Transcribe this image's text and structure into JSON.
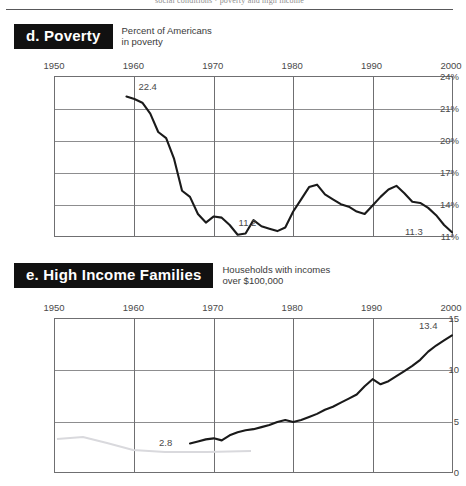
{
  "page": {
    "running_head": "social conditions  ·  poverty and high income"
  },
  "sections": [
    {
      "id": "poverty",
      "badge": "d. Poverty",
      "subtitle": "Percent of Americans\nin poverty",
      "chart_data": {
        "type": "line",
        "title": "d. Poverty",
        "subtitle": "Percent of Americans in poverty",
        "xlabel": "",
        "ylabel": "Percent of Americans in poverty",
        "xlim": [
          1950,
          2000
        ],
        "ylim": [
          11,
          24
        ],
        "xticks": [
          "1950",
          "1960",
          "1970",
          "1980",
          "1990",
          "2000"
        ],
        "yticks": [
          "24%",
          "21%",
          "20%",
          "17%",
          "14%",
          "11%"
        ],
        "grid": true,
        "legend": "none",
        "annotations": [
          {
            "text": "22.4",
            "x": 1960,
            "y": 22.4
          },
          {
            "text": "11.2",
            "x": 1974,
            "y": 11.2
          },
          {
            "text": "11.3",
            "x": 2000,
            "y": 11.3
          }
        ],
        "x": [
          1959,
          1960,
          1961,
          1962,
          1963,
          1964,
          1965,
          1966,
          1967,
          1968,
          1969,
          1970,
          1971,
          1972,
          1973,
          1974,
          1975,
          1976,
          1977,
          1978,
          1979,
          1980,
          1981,
          1982,
          1983,
          1984,
          1985,
          1986,
          1987,
          1988,
          1989,
          1990,
          1991,
          1992,
          1993,
          1994,
          1995,
          1996,
          1997,
          1998,
          1999,
          2000
        ],
        "values": [
          22.4,
          22.2,
          21.9,
          21.0,
          19.5,
          19.0,
          17.3,
          14.7,
          14.2,
          12.8,
          12.1,
          12.6,
          12.5,
          11.9,
          11.1,
          11.2,
          12.3,
          11.8,
          11.6,
          11.4,
          11.7,
          13.0,
          14.0,
          15.0,
          15.2,
          14.4,
          14.0,
          13.6,
          13.4,
          13.0,
          12.8,
          13.5,
          14.2,
          14.8,
          15.1,
          14.5,
          13.8,
          13.7,
          13.3,
          12.7,
          11.9,
          11.3
        ],
        "categories": []
      }
    },
    {
      "id": "high-income-families",
      "badge": "e. High Income Families",
      "subtitle": "Households with incomes\nover $100,000",
      "chart_data": {
        "type": "line",
        "title": "e. High Income Families",
        "subtitle": "Households with incomes over $100,000",
        "xlabel": "",
        "ylabel": "Percent of households with incomes over $100,000",
        "xlim": [
          1950,
          2000
        ],
        "ylim": [
          0,
          15
        ],
        "xticks": [
          "1950",
          "1960",
          "1970",
          "1980",
          "1990",
          "2000"
        ],
        "yticks": [
          "15",
          "10",
          "5",
          "0"
        ],
        "grid": true,
        "legend": "none",
        "annotations": [
          {
            "text": "2.8",
            "x": 1967,
            "y": 2.8
          },
          {
            "text": "13.4",
            "x": 2000,
            "y": 13.4
          }
        ],
        "x": [
          1967,
          1968,
          1969,
          1970,
          1971,
          1972,
          1973,
          1974,
          1975,
          1976,
          1977,
          1978,
          1979,
          1980,
          1981,
          1982,
          1983,
          1984,
          1985,
          1986,
          1987,
          1988,
          1989,
          1990,
          1991,
          1992,
          1993,
          1994,
          1995,
          1996,
          1997,
          1998,
          1999,
          2000
        ],
        "values": [
          2.8,
          3.0,
          3.2,
          3.3,
          3.1,
          3.6,
          3.9,
          4.1,
          4.2,
          4.4,
          4.6,
          4.9,
          5.1,
          4.9,
          5.1,
          5.4,
          5.7,
          6.1,
          6.4,
          6.8,
          7.2,
          7.6,
          8.4,
          9.1,
          8.6,
          8.9,
          9.4,
          9.9,
          10.4,
          11.0,
          11.8,
          12.4,
          12.9,
          13.4
        ],
        "categories": []
      }
    }
  ]
}
